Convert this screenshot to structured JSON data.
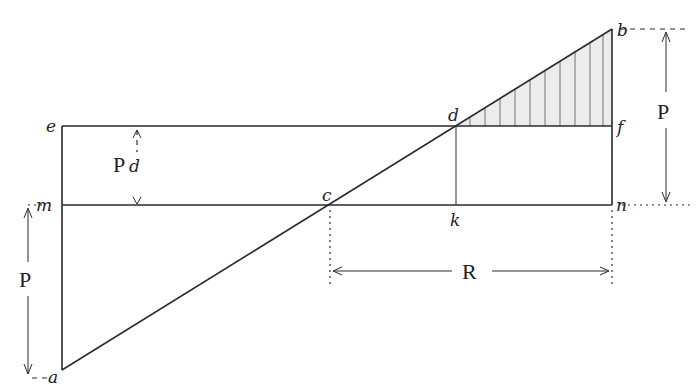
{
  "diagram": {
    "points": {
      "a": {
        "label": "a",
        "x": 62,
        "y": 370
      },
      "b": {
        "label": "b",
        "x": 612,
        "y": 29
      },
      "c": {
        "label": "c",
        "x": 330,
        "y": 205
      },
      "d": {
        "label": "d",
        "x": 456,
        "y": 126
      },
      "e": {
        "label": "e",
        "x": 62,
        "y": 126
      },
      "f": {
        "label": "f",
        "x": 612,
        "y": 126
      },
      "k": {
        "label": "k",
        "x": 456,
        "y": 205
      },
      "m": {
        "label": "m",
        "x": 62,
        "y": 205
      },
      "n": {
        "label": "n",
        "x": 612,
        "y": 205
      }
    },
    "dimensions": {
      "pd": {
        "label": "P",
        "sub": "d"
      },
      "p_left": {
        "label": "P"
      },
      "p_right": {
        "label": "P"
      },
      "r": {
        "label": "R"
      }
    },
    "colors": {
      "ink": "#2a2a2a",
      "background": "#ffffff",
      "hatch": "#555555"
    }
  }
}
